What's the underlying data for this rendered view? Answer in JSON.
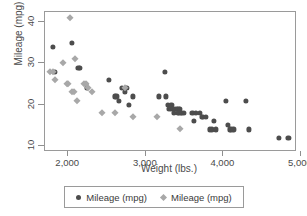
{
  "chart_data": {
    "type": "scatter",
    "title": "",
    "xlabel": "Weight (lbs.)",
    "ylabel": "Mileage (mpg)",
    "xlim": [
      1700,
      4950
    ],
    "ylim": [
      8.5,
      42.5
    ],
    "xticks": [
      2000,
      3000,
      4000,
      5000
    ],
    "xticklabels": [
      "2,000",
      "3,000",
      "4,000",
      "5,000"
    ],
    "yticks": [
      10,
      20,
      30,
      40
    ],
    "yticklabels": [
      "10",
      "20",
      "30",
      "40"
    ],
    "grid": false,
    "legend_position": "bottom",
    "series": [
      {
        "name": "Mileage (mpg)",
        "marker": "circle",
        "color": "#4d4d4d",
        "points": [
          [
            1800,
            34
          ],
          [
            1830,
            28
          ],
          [
            2050,
            35
          ],
          [
            2230,
            25
          ],
          [
            2240,
            24
          ],
          [
            2130,
            29
          ],
          [
            2150,
            29
          ],
          [
            2520,
            26
          ],
          [
            2600,
            22
          ],
          [
            2620,
            22
          ],
          [
            2650,
            21
          ],
          [
            2690,
            24
          ],
          [
            2730,
            23
          ],
          [
            2750,
            24
          ],
          [
            2780,
            20
          ],
          [
            2830,
            22
          ],
          [
            3170,
            22
          ],
          [
            3250,
            28
          ],
          [
            3260,
            22
          ],
          [
            3280,
            20
          ],
          [
            3300,
            19
          ],
          [
            3320,
            19
          ],
          [
            3330,
            20
          ],
          [
            3350,
            19
          ],
          [
            3360,
            18
          ],
          [
            3380,
            19
          ],
          [
            3400,
            19
          ],
          [
            3410,
            18
          ],
          [
            3420,
            19
          ],
          [
            3430,
            18
          ],
          [
            3440,
            19
          ],
          [
            3450,
            18
          ],
          [
            3470,
            18
          ],
          [
            3490,
            18
          ],
          [
            3600,
            18
          ],
          [
            3620,
            16
          ],
          [
            3650,
            18
          ],
          [
            3700,
            18
          ],
          [
            3720,
            17
          ],
          [
            3740,
            17
          ],
          [
            3780,
            17
          ],
          [
            3830,
            14
          ],
          [
            3850,
            14
          ],
          [
            3880,
            16
          ],
          [
            3900,
            14
          ],
          [
            4030,
            21
          ],
          [
            4060,
            15
          ],
          [
            4080,
            14
          ],
          [
            4100,
            14
          ],
          [
            4130,
            14
          ],
          [
            4290,
            21
          ],
          [
            4330,
            14
          ],
          [
            4720,
            12
          ],
          [
            4840,
            12
          ]
        ]
      },
      {
        "name": "Mileage (mpg)",
        "marker": "diamond",
        "color": "#a8a8a8",
        "points": [
          [
            1760,
            28
          ],
          [
            1800,
            28
          ],
          [
            1830,
            26
          ],
          [
            1930,
            30
          ],
          [
            1980,
            25
          ],
          [
            2000,
            25
          ],
          [
            2020,
            41
          ],
          [
            2050,
            23
          ],
          [
            2070,
            23
          ],
          [
            2090,
            31
          ],
          [
            2110,
            21
          ],
          [
            2200,
            25
          ],
          [
            2230,
            25
          ],
          [
            2250,
            24
          ],
          [
            2300,
            23
          ],
          [
            2430,
            18
          ],
          [
            2600,
            18
          ],
          [
            2730,
            24
          ],
          [
            2830,
            17
          ],
          [
            3150,
            17
          ],
          [
            3440,
            14
          ]
        ]
      }
    ]
  },
  "legend": {
    "entries": [
      {
        "label": "Mileage (mpg)",
        "marker": "circle-marker-icon"
      },
      {
        "label": "Mileage (mpg)",
        "marker": "diamond-marker-icon"
      }
    ]
  }
}
